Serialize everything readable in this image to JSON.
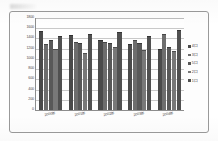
{
  "chart_data": {
    "type": "bar",
    "title": "",
    "xlabel": "",
    "ylabel": "",
    "ylim": [
      0,
      1800
    ],
    "ytick_step": 200,
    "grid": true,
    "legend_position": "right",
    "categories": [
      "2000年",
      "2001年",
      "2002年",
      "2003年",
      "2004年"
    ],
    "yticks": [
      "0",
      "200",
      "400",
      "600",
      "800",
      "1000",
      "1200",
      "1400",
      "1600",
      "1800"
    ],
    "series": [
      {
        "name": "4口",
        "values": [
          1530,
          1450,
          1350,
          1265,
          1180
        ]
      },
      {
        "name": "3口",
        "values": [
          1270,
          1310,
          1310,
          1350,
          1470
        ]
      },
      {
        "name": "5口",
        "values": [
          1360,
          1285,
          1295,
          1295,
          1205
        ]
      },
      {
        "name": "2口",
        "values": [
          1165,
          1090,
          1210,
          1150,
          1130
        ]
      },
      {
        "name": "1口",
        "values": [
          1420,
          1465,
          1500,
          1425,
          1555
        ]
      }
    ],
    "colors": [
      "#4a4a4a",
      "#6d6d6d",
      "#585858",
      "#787878",
      "#505050"
    ]
  },
  "legend": {
    "items": [
      {
        "label": "4口"
      },
      {
        "label": "3口"
      },
      {
        "label": "5口"
      },
      {
        "label": "2口"
      },
      {
        "label": "1口"
      }
    ]
  }
}
